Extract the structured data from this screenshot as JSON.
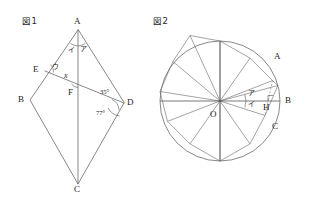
{
  "figures": [
    {
      "caption": "図1",
      "kind": "kite-with-transversal",
      "vertices": {
        "A": "A",
        "B": "B",
        "C": "C",
        "D": "D",
        "E": "E",
        "F": "F"
      },
      "angles": {
        "a_right": "ア",
        "a_left": "イ",
        "e": "ウ",
        "f": "x",
        "d_upper": "35°",
        "d_lower": "77°"
      }
    },
    {
      "caption": "図2",
      "kind": "circle-with-inscribed-12gon",
      "vertices": {
        "O": "O",
        "A": "A",
        "B": "B",
        "C": "C",
        "H": "H"
      },
      "angles": {
        "upper": "ア",
        "lower": "イ"
      },
      "segments": 12
    }
  ],
  "colors": {
    "ink": "#1c1c1c",
    "stroke": "#555555",
    "background": "#ffffff"
  }
}
